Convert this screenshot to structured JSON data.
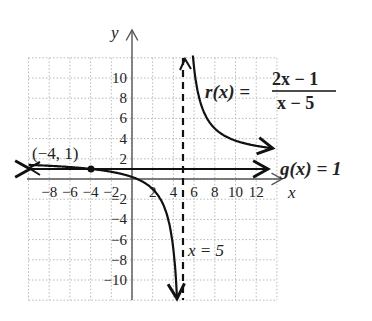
{
  "chart_data": {
    "type": "line",
    "title": "",
    "xlabel": "x",
    "ylabel": "y",
    "xlim": [
      -10,
      14
    ],
    "ylim": [
      -12,
      12
    ],
    "grid": true,
    "x_ticks": [
      "-8",
      "-6",
      "-4",
      "-2",
      "2",
      "4",
      "6",
      "8",
      "10",
      "12"
    ],
    "y_ticks": [
      "10",
      "8",
      "6",
      "4",
      "2",
      "-2",
      "-4",
      "-6",
      "-8",
      "-10"
    ],
    "series": [
      {
        "name": "r(x) = (2x - 1)/(x - 5)",
        "label_func": "r(x) =",
        "numerator": "2x − 1",
        "denominator": "x − 5",
        "kind": "rational",
        "left_branch": {
          "x": [
            -10,
            -8,
            -6,
            -4,
            -2,
            0,
            2,
            3,
            4,
            4.5
          ],
          "y": [
            1.4,
            1.31,
            1.18,
            1.0,
            0.71,
            0.2,
            -1.0,
            -2.5,
            -7.0,
            -16.0
          ]
        },
        "right_branch": {
          "x": [
            5.9,
            6,
            7,
            8,
            10,
            12,
            14
          ],
          "y": [
            12.1,
            11.0,
            6.5,
            5.0,
            3.8,
            3.29,
            3.0
          ]
        }
      },
      {
        "name": "g(x) = 1",
        "label": "g(x) = 1",
        "kind": "horizontal-asymptote",
        "y": 1
      },
      {
        "name": "x = 5",
        "label": "x = 5",
        "kind": "vertical-asymptote",
        "x": 5
      }
    ],
    "annotations": [
      {
        "text": "(−4, 1)",
        "x": -4,
        "y": 1,
        "point": true
      }
    ]
  },
  "labels": {
    "y_axis": "y",
    "x_axis": "x",
    "point": "(−4, 1)",
    "r_lhs": "r(x) =",
    "r_num": "2x − 1",
    "r_den": "x − 5",
    "g_label": "g(x) = 1",
    "asym_label": "x = 5"
  },
  "colors": {
    "grid": "#b8b8b8",
    "axis": "#555555",
    "curve": "#111111"
  }
}
